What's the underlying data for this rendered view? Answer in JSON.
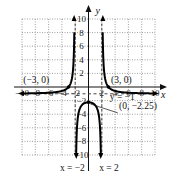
{
  "chart_data": {
    "type": "line",
    "function": "f(x) = (x^2 - 9) / (4 - x^2)",
    "title": "",
    "xlabel": "x",
    "ylabel": "y",
    "xlim": [
      -10,
      10
    ],
    "ylim": [
      -10,
      10
    ],
    "grid": true,
    "x_ticks": [
      -10,
      -8,
      -6,
      -4,
      -2,
      2,
      4,
      6,
      8,
      10
    ],
    "y_ticks": [
      10,
      8,
      6,
      4,
      2,
      -2,
      -4,
      -6,
      -8,
      -10
    ],
    "x_tick_labels": [
      "−10",
      "−8",
      "−6",
      "−4",
      "−2",
      "2",
      "4",
      "6",
      "8",
      "10"
    ],
    "y_tick_labels": [
      "10",
      "8",
      "6",
      "4",
      "2",
      "−2",
      "−4",
      "−6",
      "−8",
      "−10"
    ],
    "asymptotes": {
      "vertical": [
        -2,
        2
      ],
      "horizontal": [
        -1
      ]
    },
    "points": [
      {
        "x": -3,
        "y": 0,
        "label": "(−3, 0)"
      },
      {
        "x": 3,
        "y": 0,
        "label": "(3, 0)"
      },
      {
        "x": 0,
        "y": -2.25,
        "label": "(0, −2.25)"
      }
    ],
    "annotations": {
      "horizontal_asymptote": "y = −1",
      "left_asymptote": "x = −2",
      "right_asymptote": "x = 2"
    }
  }
}
